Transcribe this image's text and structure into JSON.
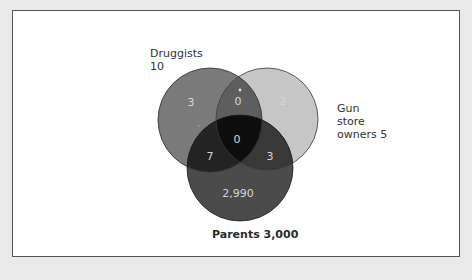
{
  "diagram": {
    "type": "venn",
    "sets": [
      {
        "name": "Druggists",
        "label": "Druggists",
        "total": "10",
        "color": "#7a7a7a"
      },
      {
        "name": "Gun store owners",
        "label_lines": [
          "Gun",
          "store",
          "owners 5"
        ],
        "total": "5",
        "color": "#c6c6c6"
      },
      {
        "name": "Parents",
        "label": "Parents 3,000",
        "total": "3,000",
        "color": "#4b4b4b"
      }
    ],
    "regions": {
      "druggists_only": "3",
      "druggists_gun": "0",
      "gun_only": "2",
      "all_three": "0",
      "druggists_parents": "7",
      "gun_parents": "3",
      "parents_only": "2,990"
    },
    "colors": {
      "background": "#e9e9e9",
      "frame": "#ffffff",
      "frame_border": "#555555",
      "center": "#0d0d0d",
      "druggists_parents": "#232323",
      "gun_parents": "#383838",
      "druggists_gun": "#5e5e5e",
      "count_text": "#d6d6d6"
    }
  },
  "labels": {
    "druggists_line1": "Druggists",
    "druggists_line2": "10",
    "gun_line1": "Gun",
    "gun_line2": "store",
    "gun_line3": "owners 5",
    "parents": "Parents 3,000"
  }
}
